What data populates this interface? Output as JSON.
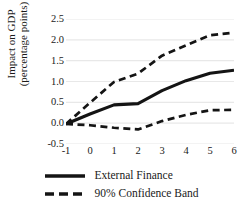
{
  "chart_data": {
    "type": "line",
    "title": "",
    "xlabel": "",
    "ylabel": "Impact on GDP (percentage points)",
    "ylabel_line1": "Impact on GDP",
    "ylabel_line2": "(percentage points)",
    "x": [
      -1,
      0,
      1,
      2,
      3,
      4,
      5,
      6
    ],
    "xtick_labels": [
      "-1",
      "0",
      "1",
      "2",
      "3",
      "4",
      "5",
      "6"
    ],
    "ytick_labels": [
      "2.5",
      "2.0",
      "1.5",
      "1.0",
      "0.5",
      "0.0",
      "-0.5"
    ],
    "ytick_values": [
      2.5,
      2.0,
      1.5,
      1.0,
      0.5,
      0.0,
      -0.5
    ],
    "xlim": [
      -1,
      6
    ],
    "ylim": [
      -0.5,
      2.5
    ],
    "grid": "horizontal",
    "grid_color": "#e8e8e8",
    "legend_position": "below",
    "line_color": "#141414",
    "series": [
      {
        "name": "External Finance",
        "style": "solid",
        "values": [
          -0.02,
          0.22,
          0.44,
          0.47,
          0.78,
          1.02,
          1.2,
          1.27
        ]
      },
      {
        "name": "90% Confidence Band",
        "style": "dashed",
        "bound": "upper",
        "values": [
          -0.02,
          0.49,
          0.99,
          1.19,
          1.62,
          1.87,
          2.11,
          2.17
        ]
      },
      {
        "name": "90% Confidence Band",
        "style": "dashed",
        "bound": "lower",
        "values": [
          -0.02,
          -0.05,
          -0.11,
          -0.15,
          0.05,
          0.2,
          0.31,
          0.32
        ]
      }
    ]
  },
  "legend": {
    "items": [
      {
        "label": "External Finance",
        "style": "solid"
      },
      {
        "label": "90% Confidence Band",
        "style": "dashed"
      }
    ]
  }
}
